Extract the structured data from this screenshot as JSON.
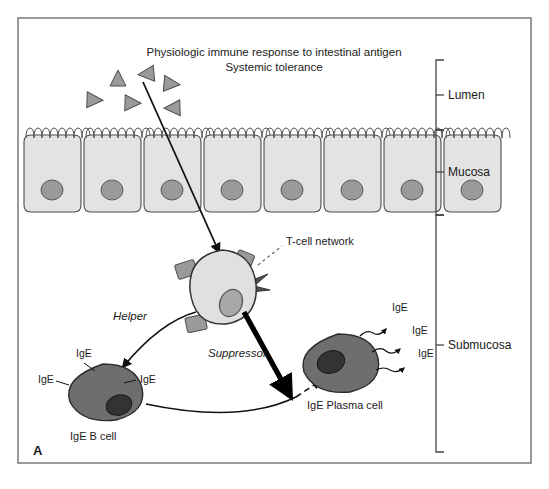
{
  "figure": {
    "panel_letter": "A",
    "title_line_1": "Physiologic immune response to intestinal antigen",
    "title_line_2": "Systemic tolerance",
    "border_color": "#808080",
    "background_color": "#ffffff"
  },
  "layers": [
    {
      "id": "lumen",
      "label": "Lumen",
      "bracket_top": 60,
      "bracket_bottom": 130
    },
    {
      "id": "mucosa",
      "label": "Mucosa",
      "bracket_top": 130,
      "bracket_bottom": 215
    },
    {
      "id": "submucosa",
      "label": "Submucosa",
      "bracket_top": 215,
      "bracket_bottom": 452
    }
  ],
  "antigens": {
    "label": "antigen-triangle",
    "count": 6,
    "fill": "#9a9a9a",
    "stroke": "#4d4d4d",
    "items": [
      {
        "cx": 118,
        "cy": 78,
        "rot": 0
      },
      {
        "cx": 146,
        "cy": 74,
        "rot": -95
      },
      {
        "cx": 172,
        "cy": 84,
        "rot": 95
      },
      {
        "cx": 95,
        "cy": 100,
        "rot": 92
      },
      {
        "cx": 133,
        "cy": 103,
        "rot": 92
      },
      {
        "cx": 172,
        "cy": 108,
        "rot": -92
      }
    ]
  },
  "epithelium": {
    "cell_count": 8,
    "cell_fill": "#e3e3e3",
    "cell_stroke": "#4d4d4d",
    "nucleus_fill": "#9a9a9a",
    "nucleus_stroke": "#5a5a5a",
    "top": 133,
    "bottom": 213
  },
  "tcell": {
    "name": "T-cell",
    "network_label": "T-cell network",
    "helper_label": "Helper",
    "suppressor_label": "Suppressor",
    "fill": "#e0e0e0",
    "stroke": "#333333",
    "nucleus_fill": "#a8a8a8",
    "receptor_fill": "#9a9a9a",
    "cx": 222,
    "cy": 287
  },
  "bcell": {
    "name": "IgE B cell",
    "label": "IgE B cell",
    "fill": "#6e6e6e",
    "stroke": "#2b2b2b",
    "nucleus_fill": "#333333",
    "cx": 103,
    "cy": 393,
    "surface_ige": [
      {
        "text": "IgE",
        "x": 76,
        "y": 357
      },
      {
        "text": "IgE",
        "x": 140,
        "y": 383
      },
      {
        "text": "IgE",
        "x": 38,
        "y": 383
      }
    ]
  },
  "plasma_cell": {
    "name": "IgE Plasma cell",
    "label": "IgE Plasma cell",
    "fill": "#6e6e6e",
    "stroke": "#2b2b2b",
    "nucleus_fill": "#333333",
    "cx": 338,
    "cy": 363,
    "secreted_ige": [
      {
        "text": "IgE",
        "x": 392,
        "y": 311
      },
      {
        "text": "IgE",
        "x": 412,
        "y": 334
      },
      {
        "text": "IgE",
        "x": 418,
        "y": 357
      }
    ]
  }
}
